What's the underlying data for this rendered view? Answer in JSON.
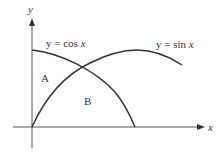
{
  "diagram": {
    "axes": {
      "x_label": "x",
      "y_label": "y"
    },
    "curves": [
      {
        "name": "cos",
        "label_prefix": "y = cos ",
        "label_var": "x"
      },
      {
        "name": "sin",
        "label_prefix": "y = sin ",
        "label_var": "x"
      }
    ],
    "regions": {
      "a": "A",
      "b": "B"
    },
    "colors": {
      "stroke": "#333333",
      "axis": "#555555",
      "text": "#333333"
    }
  }
}
